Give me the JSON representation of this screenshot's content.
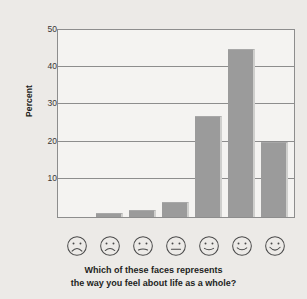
{
  "chart_data": {
    "type": "bar",
    "title": "",
    "subtitle": "",
    "xlabel": "Which of these faces represents the way you feel about life as a whole?",
    "ylabel": "Percent",
    "ylim": [
      0,
      50
    ],
    "yticks": [
      10,
      20,
      30,
      40,
      50
    ],
    "ytick_labels": [
      "10",
      "20",
      "30",
      "40",
      "50"
    ],
    "grid": true,
    "legend": null,
    "categories": [
      "face-1-very-sad",
      "face-2-sad",
      "face-3-slightly-sad",
      "face-4-neutral",
      "face-5-slightly-happy",
      "face-6-happy",
      "face-7-very-happy"
    ],
    "category_labels": [
      "1",
      "2",
      "3",
      "4",
      "5",
      "6",
      "7"
    ],
    "values": [
      0,
      1,
      2,
      4,
      27,
      45,
      20
    ],
    "bar_color": "#9b9b9b",
    "plot_background": "#f4f3f1",
    "figure_background": "#eceae7",
    "axis_color": "#8d8d8d"
  },
  "axis": {
    "y_title": "Percent",
    "ticks": [
      {
        "label": "50",
        "value": 50
      },
      {
        "label": "40",
        "value": 40
      },
      {
        "label": "30",
        "value": 30
      },
      {
        "label": "20",
        "value": 20
      },
      {
        "label": "10",
        "value": 10
      }
    ]
  },
  "faces": [
    {
      "name": "face-very-sad",
      "mood": "very-sad",
      "mouth": "deep-frown"
    },
    {
      "name": "face-sad",
      "mood": "sad",
      "mouth": "frown"
    },
    {
      "name": "face-slightly-sad",
      "mood": "slightly-sad",
      "mouth": "slight-frown"
    },
    {
      "name": "face-neutral",
      "mood": "neutral",
      "mouth": "flat"
    },
    {
      "name": "face-slightly-happy",
      "mood": "slightly-happy",
      "mouth": "slight-smile"
    },
    {
      "name": "face-happy",
      "mood": "happy",
      "mouth": "smile"
    },
    {
      "name": "face-very-happy",
      "mood": "very-happy",
      "mouth": "big-smile"
    }
  ],
  "caption": {
    "line1": "Which of these faces represents",
    "line2": "the way you feel about life as a whole?"
  }
}
